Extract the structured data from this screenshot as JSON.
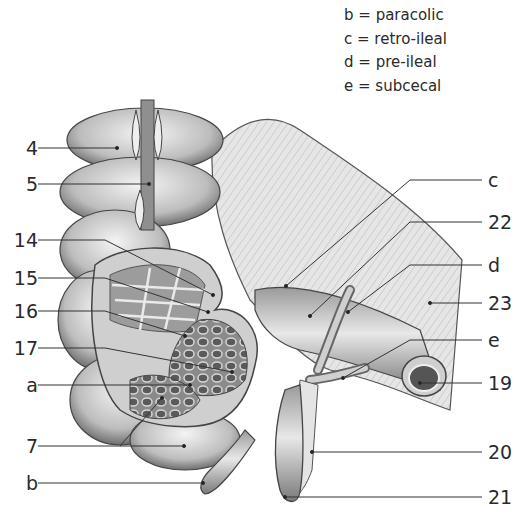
{
  "figure": {
    "type": "anatomical-illustration"
  },
  "legend": [
    {
      "key": "b",
      "text": "b = paracolic"
    },
    {
      "key": "c",
      "text": "c = retro-ileal"
    },
    {
      "key": "d",
      "text": "d = pre-ileal"
    },
    {
      "key": "e",
      "text": "e = subcecal"
    }
  ],
  "labels_left": [
    {
      "id": "4",
      "text": "4",
      "y": 148,
      "target": [
        117,
        148
      ]
    },
    {
      "id": "5",
      "text": "5",
      "y": 184,
      "target": [
        149,
        184
      ]
    },
    {
      "id": "14",
      "text": "14",
      "y": 240,
      "target": [
        213,
        295
      ]
    },
    {
      "id": "15",
      "text": "15",
      "y": 278,
      "target": [
        208,
        312
      ]
    },
    {
      "id": "16",
      "text": "16",
      "y": 311,
      "target": [
        185,
        336
      ]
    },
    {
      "id": "17",
      "text": "17",
      "y": 348,
      "target": [
        232,
        372
      ]
    },
    {
      "id": "a",
      "text": "a",
      "y": 385,
      "target": [
        190,
        385
      ]
    },
    {
      "id": "7",
      "text": "7",
      "y": 446,
      "target": [
        184,
        446
      ],
      "target2": [
        162,
        398
      ]
    },
    {
      "id": "b",
      "text": "b",
      "y": 483,
      "target": [
        203,
        483
      ]
    }
  ],
  "labels_right": [
    {
      "id": "c",
      "text": "c",
      "y": 180,
      "target": [
        286,
        286
      ]
    },
    {
      "id": "22",
      "text": "22",
      "y": 222,
      "target": [
        310,
        316
      ]
    },
    {
      "id": "d",
      "text": "d",
      "y": 265,
      "target": [
        348,
        312
      ]
    },
    {
      "id": "23",
      "text": "23",
      "y": 303,
      "target": [
        430,
        303
      ]
    },
    {
      "id": "e",
      "text": "e",
      "y": 340,
      "target": [
        343,
        378
      ]
    },
    {
      "id": "19",
      "text": "19",
      "y": 383,
      "target": [
        420,
        383
      ]
    },
    {
      "id": "20",
      "text": "20",
      "y": 452,
      "target": [
        312,
        452
      ]
    },
    {
      "id": "21",
      "text": "21",
      "y": 497,
      "target": [
        285,
        497
      ]
    }
  ]
}
